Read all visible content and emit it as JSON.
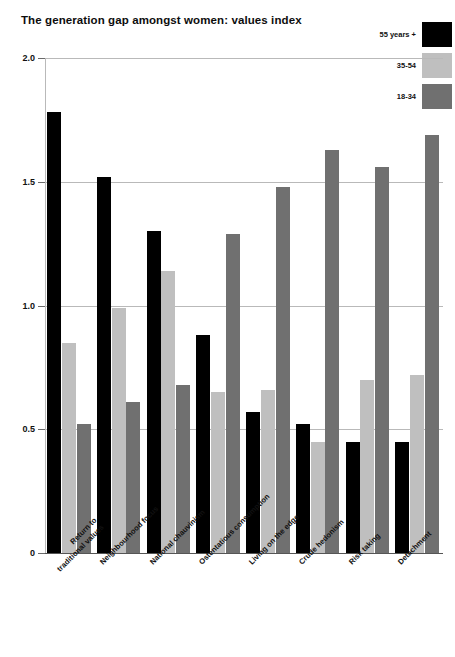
{
  "chart": {
    "title": "The generation gap amongst women: values index"
  },
  "legend": {
    "position": "top-right",
    "items": [
      {
        "label": "55 years +",
        "color": "#000000"
      },
      {
        "label": "35-54",
        "color": "#bfbfbf"
      },
      {
        "label": "18-34",
        "color": "#707070"
      }
    ]
  },
  "axis": {
    "y_ticks": [
      "2.0",
      "1.5",
      "1.0",
      "0.5",
      "0"
    ]
  },
  "chart_data": {
    "type": "bar",
    "title": "The generation gap amongst women: values index",
    "xlabel": "",
    "ylabel": "",
    "ylim": [
      0,
      2.0
    ],
    "yticks": [
      0,
      0.5,
      1.0,
      1.5,
      2.0
    ],
    "grid": true,
    "legend_position": "top-right",
    "categories": [
      "Return to\ntraditional values",
      "Neighbourhood focus",
      "National chauvinism",
      "Ostentatious consumption",
      "Living on the edge",
      "Crude hedonism",
      "Risk taking",
      "Detachment"
    ],
    "series": [
      {
        "name": "55 years +",
        "color": "#000000",
        "values": [
          1.78,
          1.52,
          1.3,
          0.88,
          0.57,
          0.52,
          0.45,
          0.45
        ]
      },
      {
        "name": "35-54",
        "color": "#bfbfbf",
        "values": [
          0.85,
          0.99,
          1.14,
          0.65,
          0.66,
          0.45,
          0.7,
          0.72
        ]
      },
      {
        "name": "18-34",
        "color": "#707070",
        "values": [
          0.52,
          0.61,
          0.68,
          1.29,
          1.48,
          1.63,
          1.56,
          1.69
        ]
      }
    ]
  }
}
